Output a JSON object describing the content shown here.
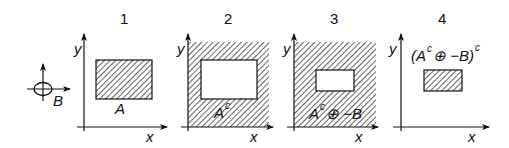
{
  "figure": {
    "colors": {
      "ink": "#111111",
      "background": "#ffffff",
      "hatch": "#222222"
    },
    "structuring_element": {
      "label": "B",
      "icon": "crosshair-ellipse-icon"
    },
    "panels": [
      {
        "number": "1",
        "axis_x": "x",
        "axis_y": "y",
        "region_label": "A",
        "region_sup": "",
        "region_rest": ""
      },
      {
        "number": "2",
        "axis_x": "x",
        "axis_y": "y",
        "region_label": "A",
        "region_sup": "c",
        "region_rest": ""
      },
      {
        "number": "3",
        "axis_x": "x",
        "axis_y": "y",
        "region_label": "A",
        "region_sup": "c",
        "region_rest": "⊕ −B"
      },
      {
        "number": "4",
        "axis_x": "x",
        "axis_y": "y",
        "region_label": "(A",
        "region_sup": "c",
        "region_rest": "⊕ −B)",
        "region_sup2": "c"
      }
    ]
  }
}
